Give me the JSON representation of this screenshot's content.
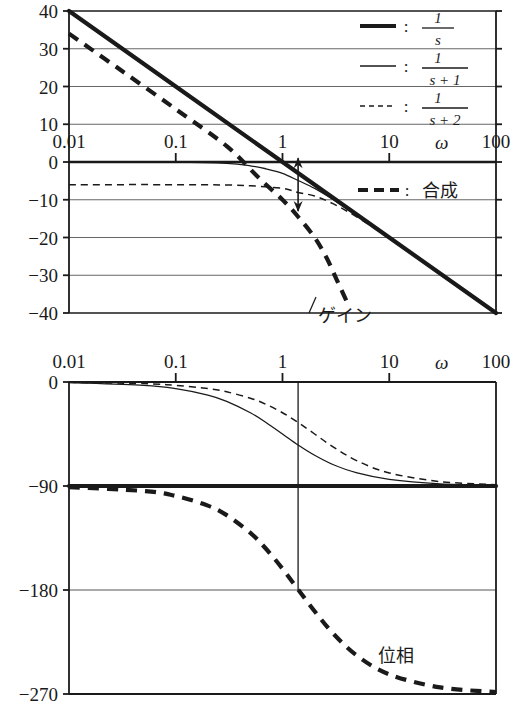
{
  "figure": {
    "type": "bode-plot",
    "colors": {
      "ink": "#1a1a1a",
      "grid": "#555555",
      "axis": "#1a1a1a"
    }
  },
  "legend": {
    "entries": [
      {
        "id": "one-over-s",
        "style": "thick-solid",
        "colon": ":",
        "numerator": "1",
        "denominator": "s"
      },
      {
        "id": "one-over-s-p-1",
        "style": "thin-solid",
        "colon": ":",
        "numerator": "1",
        "denominator": "s + 1"
      },
      {
        "id": "one-over-s-p-2",
        "style": "thin-dashed",
        "colon": ":",
        "numerator": "1",
        "denominator": "s + 2"
      }
    ],
    "composite": {
      "id": "composite",
      "style": "thick-dashed",
      "colon": ":",
      "label": "合成"
    }
  },
  "annotations": {
    "gain_label": "ゲイン",
    "phase_label": "位相",
    "omega_symbol": "ω",
    "gain_margin_arrow": {
      "name": "gain-difference-arrow",
      "omega": 1.4,
      "from_db": 1,
      "to_db": -13
    },
    "phase_crossover_line": {
      "name": "phase-crossover-line",
      "omega": 1.4,
      "phase_deg": -180
    }
  },
  "chart_data": [
    {
      "type": "line",
      "id": "magnitude-plot",
      "title": "ゲイン",
      "xlabel": "ω",
      "ylabel": "",
      "xscale": "log",
      "xlim": [
        0.01,
        100
      ],
      "ylim": [
        -40,
        40
      ],
      "xticks": [
        0.01,
        0.1,
        1,
        10,
        100
      ],
      "xtick_labels": [
        "0.01",
        "0.1",
        "1",
        "10",
        "100"
      ],
      "yticks": [
        40,
        30,
        20,
        10,
        0,
        -10,
        -20,
        -30,
        -40
      ],
      "ytick_labels": [
        "40",
        "30",
        "20",
        "10",
        "0",
        "-10",
        "-20",
        "-30",
        "-40"
      ],
      "grid": true,
      "series": [
        {
          "name": "1/s",
          "style": "thick-solid",
          "x": [
            0.01,
            0.1,
            1,
            10,
            100
          ],
          "values": [
            40,
            20,
            0,
            -20,
            -40
          ]
        },
        {
          "name": "1/(s+1)",
          "style": "thin-solid",
          "x": [
            0.01,
            0.1,
            0.3,
            0.5,
            0.7,
            1,
            1.4,
            2,
            3,
            5,
            10,
            30,
            100
          ],
          "values": [
            0,
            -0.04,
            -0.37,
            -1.0,
            -1.8,
            -3.0,
            -4.9,
            -7.0,
            -10.0,
            -14.2,
            -20.0,
            -29.5,
            -40.0
          ]
        },
        {
          "name": "1/(s+2)",
          "style": "thin-dashed",
          "x": [
            0.01,
            0.1,
            0.3,
            0.5,
            1,
            1.4,
            2,
            3,
            5,
            10,
            30,
            100
          ],
          "values": [
            -6.0,
            -6.0,
            -6.1,
            -6.3,
            -7.0,
            -8.1,
            -9.0,
            -11.1,
            -14.6,
            -20.2,
            -29.6,
            -40.0
          ]
        },
        {
          "name": "合成",
          "style": "thick-dashed",
          "x": [
            0.01,
            0.03,
            0.1,
            0.3,
            0.6,
            1,
            1.4,
            2,
            2.6,
            3.2,
            4
          ],
          "values": [
            34,
            24.5,
            14,
            4.2,
            -4.2,
            -10,
            -14.5,
            -20,
            -25.5,
            -31,
            -37
          ]
        }
      ]
    },
    {
      "type": "line",
      "id": "phase-plot",
      "title": "位相",
      "xlabel": "ω",
      "ylabel": "",
      "xscale": "log",
      "xlim": [
        0.01,
        100
      ],
      "ylim": [
        -270,
        0
      ],
      "xticks": [
        0.01,
        0.1,
        1,
        10,
        100
      ],
      "xtick_labels": [
        "0.01",
        "0.1",
        "1",
        "10",
        "100"
      ],
      "yticks": [
        0,
        -90,
        -180,
        -270
      ],
      "ytick_labels": [
        "0",
        "-90",
        "-180",
        "-270"
      ],
      "grid": true,
      "series": [
        {
          "name": "1/s",
          "style": "thick-solid",
          "x": [
            0.01,
            100
          ],
          "values": [
            -90,
            -90
          ]
        },
        {
          "name": "1/(s+1)",
          "style": "thin-solid",
          "x": [
            0.01,
            0.05,
            0.1,
            0.2,
            0.3,
            0.5,
            0.7,
            1,
            1.4,
            2,
            3,
            5,
            10,
            30,
            100
          ],
          "values": [
            -0.6,
            -2.9,
            -5.7,
            -11.3,
            -16.7,
            -26.6,
            -35.0,
            -45.0,
            -54.5,
            -63.4,
            -71.6,
            -78.7,
            -84.3,
            -88.1,
            -89.4
          ]
        },
        {
          "name": "1/(s+2)",
          "style": "thin-dashed",
          "x": [
            0.01,
            0.05,
            0.1,
            0.2,
            0.3,
            0.5,
            0.7,
            1,
            1.4,
            2,
            3,
            5,
            10,
            30,
            100
          ],
          "values": [
            -0.3,
            -1.4,
            -2.9,
            -5.7,
            -8.5,
            -14.0,
            -19.3,
            -26.6,
            -35.0,
            -45.0,
            -56.3,
            -68.2,
            -78.7,
            -86.2,
            -88.9
          ]
        },
        {
          "name": "合成",
          "style": "thick-dashed",
          "x": [
            0.01,
            0.05,
            0.1,
            0.2,
            0.3,
            0.5,
            0.7,
            1,
            1.4,
            2,
            3,
            5,
            10,
            30,
            100
          ],
          "values": [
            -90.9,
            -94.3,
            -98.6,
            -107,
            -115.2,
            -130.6,
            -144.3,
            -161.6,
            -179.5,
            -198.4,
            -217.9,
            -236.9,
            -253,
            -264.3,
            -268.3
          ]
        }
      ]
    }
  ]
}
